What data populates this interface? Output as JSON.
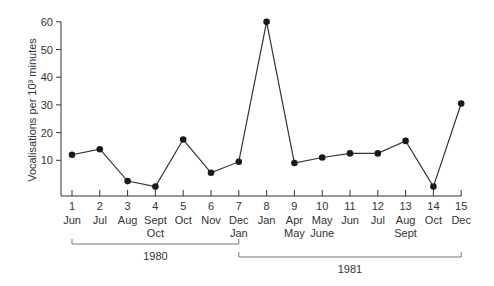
{
  "chart_data": {
    "type": "line",
    "title": "",
    "xlabel": "",
    "ylabel": "Vocalisations per 10³ minutes",
    "ylim": [
      0,
      60
    ],
    "yticks": [
      10,
      20,
      30,
      40,
      50,
      60
    ],
    "grid": false,
    "legend": null,
    "x": [
      1,
      2,
      3,
      4,
      5,
      6,
      7,
      8,
      9,
      10,
      11,
      12,
      13,
      14,
      15
    ],
    "x_month_labels": [
      [
        "Jun"
      ],
      [
        "Jul"
      ],
      [
        "Aug"
      ],
      [
        "Sept",
        "Oct"
      ],
      [
        "Oct"
      ],
      [
        "Nov"
      ],
      [
        "Dec",
        "Jan"
      ],
      [
        "Jan"
      ],
      [
        "Apr",
        "May"
      ],
      [
        "May",
        "June"
      ],
      [
        "Jun"
      ],
      [
        "Jul"
      ],
      [
        "Aug",
        "Sept"
      ],
      [
        "Oct"
      ],
      [
        "Dec"
      ]
    ],
    "series": [
      {
        "name": "Vocalisations",
        "values": [
          12,
          14,
          2.5,
          0.5,
          17.5,
          5.5,
          9.5,
          60,
          9,
          11,
          12.5,
          12.5,
          17,
          0.5,
          30.5
        ]
      }
    ],
    "year_brackets": [
      {
        "label": "1980",
        "from": 1,
        "to": 7
      },
      {
        "label": "1981",
        "from": 7,
        "to": 15
      }
    ]
  }
}
